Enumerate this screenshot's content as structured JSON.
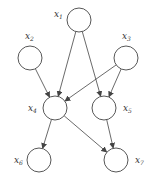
{
  "diagram": {
    "type": "directed-graph",
    "nodes": [
      {
        "id": "x1",
        "label": "x",
        "sub": "1",
        "cx": 79,
        "cy": 20,
        "lx": 54,
        "ly": 17
      },
      {
        "id": "x2",
        "label": "x",
        "sub": "2",
        "cx": 30,
        "cy": 58,
        "lx": 25,
        "ly": 39
      },
      {
        "id": "x3",
        "label": "x",
        "sub": "3",
        "cx": 126,
        "cy": 58,
        "lx": 122,
        "ly": 39
      },
      {
        "id": "x4",
        "label": "x",
        "sub": "4",
        "cx": 55,
        "cy": 108,
        "lx": 28,
        "ly": 111
      },
      {
        "id": "x5",
        "label": "x",
        "sub": "5",
        "cx": 104,
        "cy": 108,
        "lx": 123,
        "ly": 111
      },
      {
        "id": "x6",
        "label": "x",
        "sub": "6",
        "cx": 39,
        "cy": 160,
        "lx": 14,
        "ly": 163
      },
      {
        "id": "x7",
        "label": "x",
        "sub": "7",
        "cx": 116,
        "cy": 160,
        "lx": 135,
        "ly": 163
      }
    ],
    "edges": [
      {
        "from": "x1",
        "to": "x4"
      },
      {
        "from": "x1",
        "to": "x5"
      },
      {
        "from": "x2",
        "to": "x4"
      },
      {
        "from": "x3",
        "to": "x4"
      },
      {
        "from": "x3",
        "to": "x5"
      },
      {
        "from": "x4",
        "to": "x6"
      },
      {
        "from": "x4",
        "to": "x7"
      },
      {
        "from": "x5",
        "to": "x7"
      }
    ],
    "radius": 12,
    "stroke_color": "#444444"
  }
}
